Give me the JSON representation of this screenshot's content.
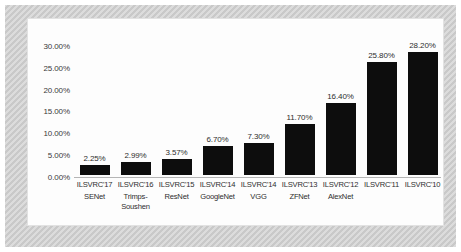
{
  "chart_data": {
    "type": "bar",
    "title": "",
    "subtitle": "",
    "xlabel": "",
    "ylabel": "",
    "categories": [
      "ILSVRC'17\nSENet",
      "ILSVRC'16\nTrimps-Soushen",
      "ILSVRC'15\nResNet",
      "ILSVRC'14\nGoogleNet",
      "ILSVRC'14\nVGG",
      "ILSVRC'13\nZFNet",
      "ILSVRC'12\nAlexNet",
      "ILSVRC'11",
      "ILSVRC'10"
    ],
    "years": [
      "ILSVRC'17",
      "ILSVRC'16",
      "ILSVRC'15",
      "ILSVRC'14",
      "ILSVRC'14",
      "ILSVRC'13",
      "ILSVRC'12",
      "ILSVRC'11",
      "ILSVRC'10"
    ],
    "models": [
      "SENet",
      "Trimps-Soushen",
      "ResNet",
      "GoogleNet",
      "VGG",
      "ZFNet",
      "AlexNet",
      "",
      ""
    ],
    "values": [
      2.25,
      2.99,
      3.57,
      6.7,
      7.3,
      11.7,
      16.4,
      25.8,
      28.2
    ],
    "data_labels": [
      "2.25%",
      "2.99%",
      "3.57%",
      "6.70%",
      "7.30%",
      "11.70%",
      "16.40%",
      "25.80%",
      "28.20%"
    ],
    "ylim": [
      0,
      32.5
    ],
    "y_ticks": [
      0,
      5,
      10,
      15,
      20,
      25,
      30
    ],
    "y_tick_labels": [
      "0.00%",
      "5.00%",
      "10.00%",
      "15.00%",
      "20.00%",
      "25.00%",
      "30.00%"
    ],
    "grid": false,
    "legend": false,
    "bar_color": "#0d0d0d",
    "plot_background": "#fdfdfd",
    "frame_color": "#c9c9c9",
    "axis_color": "#b5b5b5",
    "text_color": "#2e2e2e"
  }
}
